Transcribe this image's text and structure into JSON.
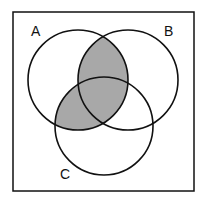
{
  "diagram": {
    "type": "venn",
    "sets": [
      {
        "id": "A",
        "label": "A",
        "cx": 78,
        "cy": 80,
        "r": 50
      },
      {
        "id": "B",
        "label": "B",
        "cx": 128,
        "cy": 80,
        "r": 50
      },
      {
        "id": "C",
        "label": "C",
        "cx": 104,
        "cy": 126,
        "r": 49
      }
    ],
    "shaded_regions": [
      "A∩B",
      "A∩C"
    ],
    "colors": {
      "shade": "#a8a8a8",
      "stroke": "#111111",
      "background": "#ffffff"
    },
    "labels": {
      "a": "A",
      "b": "B",
      "c": "C"
    }
  }
}
